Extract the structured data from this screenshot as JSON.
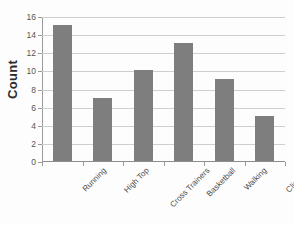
{
  "chart_data": {
    "type": "bar",
    "title": "",
    "xlabel": "",
    "ylabel": "Count",
    "categories": [
      "Running",
      "High Top",
      "Cross Trainers",
      "Basketball",
      "Walking",
      "Climbing"
    ],
    "values": [
      15,
      7,
      10,
      13,
      9,
      5
    ],
    "ylim": [
      0,
      16
    ],
    "ytick_step": 2,
    "yticks": [
      16,
      14,
      12,
      10,
      8,
      6,
      4,
      2,
      0
    ],
    "grid": "horizontal",
    "legend": "none",
    "bar_color": "#7e7e7e",
    "gridline_color": "#cfcfcf",
    "axis_color": "#8e8e8e",
    "background_color": "#fdfdfd"
  }
}
